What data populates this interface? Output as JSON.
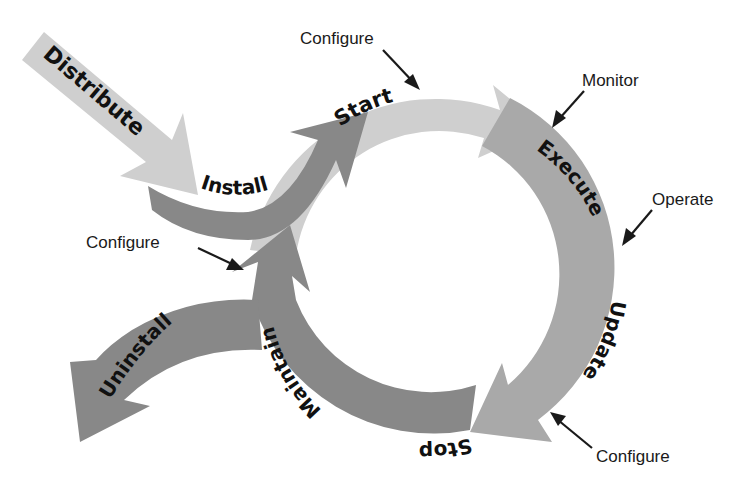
{
  "diagram": {
    "colors": {
      "light": "#cfcfcf",
      "mid": "#a9a9a9",
      "dark": "#888888",
      "text": "#111111",
      "callout_arrow": "#1a1a1a",
      "background": "#ffffff"
    },
    "stages": {
      "distribute": "Distribute",
      "install": "Install",
      "start": "Start",
      "execute": "Execute",
      "update": "Update",
      "stop": "Stop",
      "maintain": "Maintain",
      "uninstall": "Uninstall"
    },
    "callouts": {
      "configure_start": "Configure",
      "monitor": "Monitor",
      "operate": "Operate",
      "configure_update": "Configure",
      "configure_maintain": "Configure"
    }
  }
}
